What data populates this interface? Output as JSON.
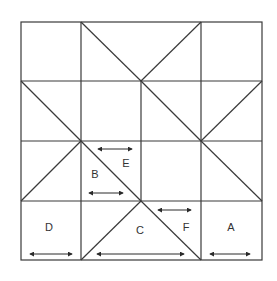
{
  "diagram": {
    "type": "quilt-block-grid",
    "grid": {
      "cols": 4,
      "rows": 4
    },
    "colors": {
      "line": "#3a3a3a",
      "background": "#ffffff",
      "label": "#333333"
    },
    "labels": [
      {
        "id": "A",
        "text": "A"
      },
      {
        "id": "B",
        "text": "B"
      },
      {
        "id": "C",
        "text": "C"
      },
      {
        "id": "D",
        "text": "D"
      },
      {
        "id": "E",
        "text": "E"
      },
      {
        "id": "F",
        "text": "F"
      }
    ],
    "grain_arrows": [
      "A",
      "B",
      "C",
      "D",
      "E",
      "F"
    ]
  }
}
